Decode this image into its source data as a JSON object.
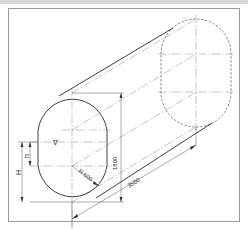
{
  "drawing": {
    "subject": "horizontal capsule tank isometric",
    "labels": {
      "length": "3500",
      "height": "1800",
      "radius": "R 600",
      "H": "H",
      "h": "h",
      "liquid_level": "∇"
    }
  }
}
